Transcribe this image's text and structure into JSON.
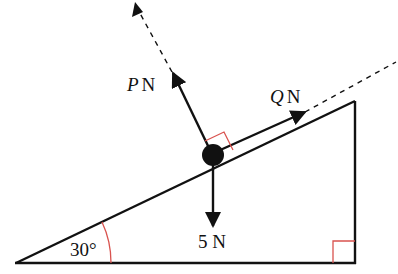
{
  "diagram": {
    "type": "inclined-plane-force-diagram",
    "colors": {
      "line": "#111111",
      "right_angle_marker": "#d9534f",
      "background": "#ffffff"
    },
    "incline": {
      "angle_label": "30°",
      "angle_deg": 30
    },
    "forces": {
      "P": {
        "symbol": "P",
        "unit": "N",
        "direction": "perpendicular to slope (outward)"
      },
      "Q": {
        "symbol": "Q",
        "unit": "N",
        "direction": "up the slope"
      },
      "W": {
        "value": "5",
        "unit": "N",
        "direction": "vertically down"
      }
    },
    "labels": {
      "p_symbol": "P",
      "p_unit": "N",
      "q_symbol": "Q",
      "q_unit": "N",
      "weight": "5 N",
      "angle": "30°"
    }
  }
}
